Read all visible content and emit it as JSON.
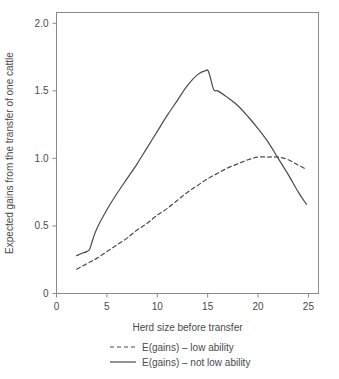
{
  "chart_data": {
    "type": "line",
    "title": "",
    "xlabel": "Herd size before transfer",
    "ylabel": "Expected gains from the transfer of one cattle",
    "xlim": [
      0,
      26
    ],
    "ylim": [
      0,
      2.08
    ],
    "xticks": [
      0,
      5,
      10,
      15,
      20,
      25
    ],
    "xtick_labels": [
      "0",
      "5",
      "10",
      "15",
      "20",
      "25"
    ],
    "yticks": [
      0,
      0.5,
      1.0,
      1.5,
      2.0
    ],
    "ytick_labels": [
      "0",
      "0.5",
      "1.0",
      "1.5",
      "2.0"
    ],
    "grid": false,
    "legend_position": "bottom",
    "series": [
      {
        "name": "E(gains) – low ability",
        "style": "dashed",
        "color": "#4a4a4a",
        "x": [
          2.0,
          2.5,
          3.0,
          3.5,
          4.0,
          5.0,
          6.0,
          7.0,
          8.0,
          9.0,
          10.0,
          11.0,
          12.0,
          13.0,
          14.0,
          15.0,
          16.0,
          17.0,
          18.0,
          19.0,
          20.0,
          21.0,
          22.0,
          23.0,
          24.0,
          24.8
        ],
        "values": [
          0.18,
          0.2,
          0.22,
          0.24,
          0.26,
          0.31,
          0.36,
          0.41,
          0.47,
          0.52,
          0.58,
          0.63,
          0.69,
          0.75,
          0.8,
          0.85,
          0.89,
          0.93,
          0.96,
          0.99,
          1.01,
          1.01,
          1.01,
          0.99,
          0.95,
          0.92
        ]
      },
      {
        "name": "E(gains) – not low ability",
        "style": "solid",
        "color": "#4a4a4a",
        "x": [
          2.0,
          2.6,
          3.0,
          3.3,
          3.6,
          4.0,
          5.0,
          6.0,
          7.0,
          8.0,
          9.0,
          10.0,
          11.0,
          12.0,
          13.0,
          14.0,
          14.8,
          15.1,
          15.6,
          16.0,
          17.0,
          18.0,
          19.0,
          20.0,
          21.0,
          22.0,
          23.0,
          24.0,
          24.8
        ],
        "values": [
          0.28,
          0.3,
          0.31,
          0.33,
          0.4,
          0.48,
          0.62,
          0.74,
          0.85,
          0.96,
          1.08,
          1.2,
          1.32,
          1.43,
          1.54,
          1.62,
          1.65,
          1.64,
          1.51,
          1.5,
          1.45,
          1.39,
          1.31,
          1.22,
          1.12,
          1.0,
          0.88,
          0.75,
          0.66
        ]
      }
    ]
  },
  "legend": {
    "items": [
      {
        "label": "E(gains) – low ability",
        "style": "dashed"
      },
      {
        "label": "E(gains) – not low ability",
        "style": "solid"
      }
    ]
  }
}
